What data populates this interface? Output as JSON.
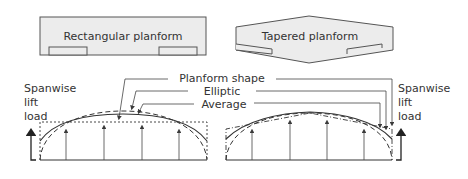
{
  "diagram": {
    "colors": {
      "wing_fill": "#ececec",
      "stroke": "#555555",
      "curve": "#3a3a3a",
      "text": "#333333",
      "background": "#ffffff"
    },
    "planforms": [
      {
        "id": "rectangular",
        "label": "Rectangular planform"
      },
      {
        "id": "tapered",
        "label": "Tapered planform"
      }
    ],
    "legend": {
      "planform_shape": "Planform shape",
      "elliptic": "Elliptic",
      "average": "Average"
    },
    "axis_labels": {
      "left": [
        "Spanwise",
        "lift",
        "load"
      ],
      "right": [
        "Spanwise",
        "lift",
        "load"
      ]
    }
  }
}
